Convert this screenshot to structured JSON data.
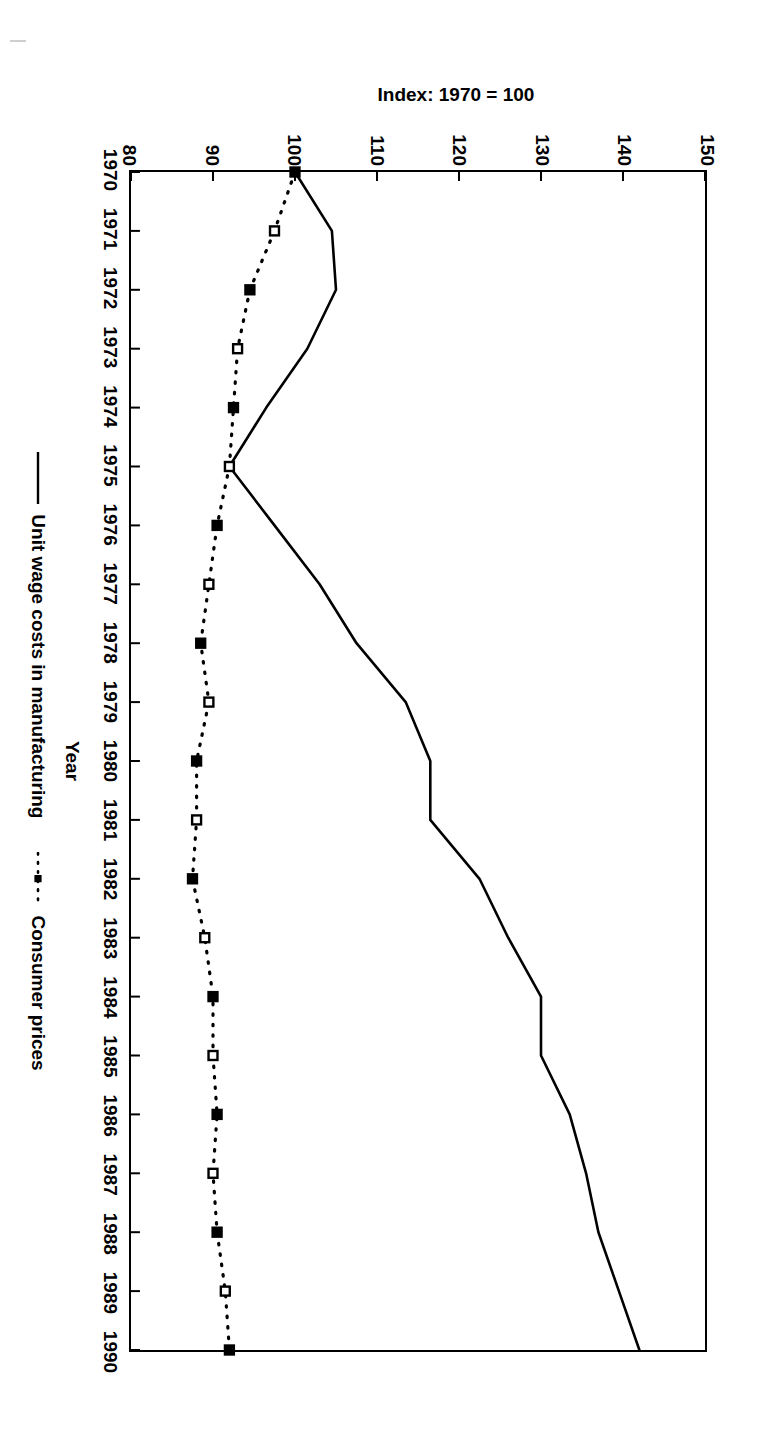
{
  "chart_data": {
    "type": "line",
    "title": "",
    "xlabel": "Year",
    "ylabel": "Index: 1970 = 100",
    "ylim": [
      80,
      150
    ],
    "yticks": [
      80,
      90,
      100,
      110,
      120,
      130,
      140,
      150
    ],
    "xlim": [
      1970,
      1990
    ],
    "grid": false,
    "legend_position": "below-axis",
    "orientation_note": "figure printed rotated 90 degrees clockwise on the page",
    "categories": [
      1970,
      1971,
      1972,
      1973,
      1974,
      1975,
      1976,
      1977,
      1978,
      1979,
      1980,
      1981,
      1982,
      1983,
      1984,
      1985,
      1986,
      1987,
      1988,
      1989,
      1990
    ],
    "xtick_labels": [
      "1970",
      "1971",
      "1972",
      "1973",
      "1974",
      "1975",
      "1976",
      "1977",
      "1978",
      "1979",
      "1980",
      "1981",
      "1982",
      "1983",
      "1984",
      "1985",
      "1986",
      "1987",
      "1988",
      "1989",
      "1990"
    ],
    "ytick_labels": [
      "80",
      "90",
      "100",
      "110",
      "120",
      "130",
      "140",
      "150"
    ],
    "series": [
      {
        "name": "Unit wage costs in manufacturing",
        "style": "solid",
        "marker": "none",
        "color": "#000000",
        "values": [
          100,
          104.5,
          105,
          101.5,
          96.5,
          92,
          97.5,
          103,
          107.5,
          113.5,
          116.5,
          116.5,
          122.5,
          126,
          130,
          130,
          133.5,
          135.5,
          137,
          139.5,
          142
        ]
      },
      {
        "name": "Consumer prices",
        "style": "dotted",
        "marker": "square",
        "color": "#000000",
        "values": [
          100,
          97.5,
          94.5,
          93,
          92.5,
          92,
          90.5,
          89.5,
          88.5,
          89.5,
          88,
          88,
          87.5,
          89,
          90,
          90,
          90.5,
          90,
          90.5,
          91.5,
          92
        ]
      }
    ]
  },
  "legend": {
    "entries": [
      {
        "label": "Unit wage costs in manufacturing",
        "swatch": "solid-line-swatch"
      },
      {
        "label": "Consumer prices",
        "swatch": "dotted-line-square-marker-swatch"
      }
    ]
  },
  "axes": {
    "x_title": "Year",
    "y_title": "Index: 1970 = 100"
  },
  "colors": {
    "line": "#000000",
    "frame": "#000000",
    "background": "#ffffff"
  }
}
